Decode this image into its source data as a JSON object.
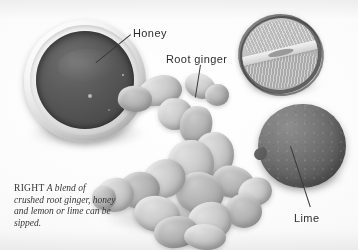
{
  "figure": {
    "medium": "grayscale-photograph",
    "background_color": "#fdfdfd",
    "subjects": [
      "honey bowl",
      "root ginger",
      "cut lime half",
      "whole lime"
    ]
  },
  "callouts": [
    {
      "id": "honey",
      "label": "Honey"
    },
    {
      "id": "root-ginger",
      "label": "Root ginger"
    },
    {
      "id": "lime",
      "label": "Lime"
    }
  ],
  "caption": {
    "lead": "RIGHT",
    "text": " A blend of crushed root ginger, honey and lemon or lime can be sipped."
  },
  "colors": {
    "background": "#fdfdfd",
    "honey_fill": "#545454",
    "bowl_rim": "#e9e9e9",
    "ginger_flesh": "#cfcdc5",
    "lime_rind": "#616161",
    "lime_flesh": "#c0c0c0",
    "leader_line": "#3a3a3a",
    "text": "#2e2e2e"
  }
}
